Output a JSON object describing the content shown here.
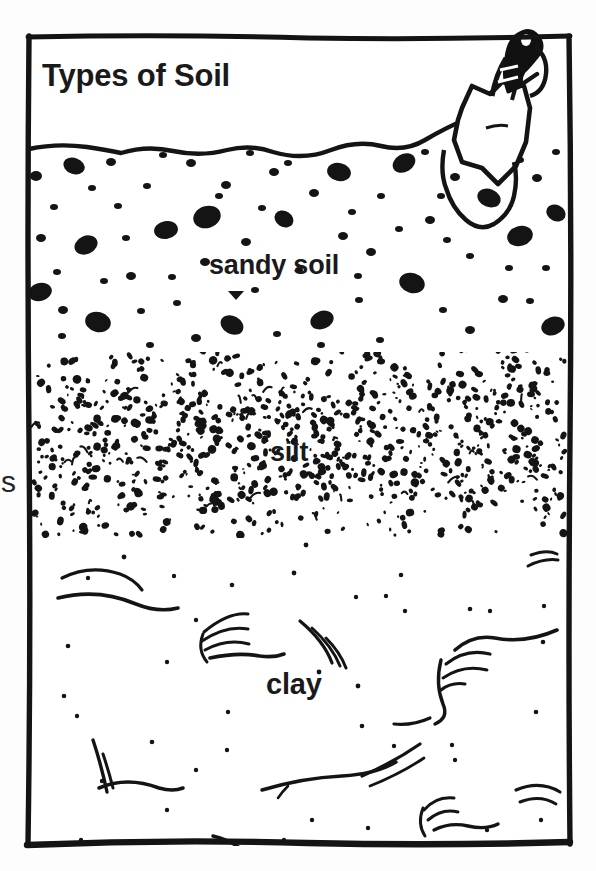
{
  "figure": {
    "title": "Types of Soil",
    "kind": "soil-profile-diagram",
    "style": "hand-drawn black and white line illustration",
    "background_color": "#fdfdfd",
    "ink_color": "#1a1a1a"
  },
  "frame": {
    "name": "illustration-border",
    "left": 27,
    "top": 35,
    "right": 570,
    "bottom": 845
  },
  "layers": [
    {
      "id": "air",
      "label": "",
      "top": 35,
      "bottom": 145,
      "texture": "blank",
      "note": "white band above ground line that holds the title"
    },
    {
      "id": "sandy",
      "label": "sandy soil",
      "top": 145,
      "bottom": 360,
      "texture": "coarse-speckle",
      "particle_size": "large"
    },
    {
      "id": "silt",
      "label": "silt",
      "top": 360,
      "bottom": 532,
      "texture": "fine-dense-speckle",
      "particle_size": "small"
    },
    {
      "id": "clay",
      "label": "clay",
      "top": 532,
      "bottom": 845,
      "texture": "curved-arc-strokes",
      "particle_size": "sparse-dots"
    }
  ],
  "labels": {
    "title": "Types of Soil",
    "sandy": "sandy soil",
    "silt": "silt",
    "clay": "clay",
    "edge_letter": "s"
  },
  "tool": {
    "name": "garden-trowel",
    "description": "trowel with dark handle, hanging loop at top, white pointed blade pushed into the sandy soil",
    "handle_color": "#111111",
    "blade_color": "#ffffff",
    "x": 455,
    "y": 30,
    "width": 105,
    "height": 180
  }
}
